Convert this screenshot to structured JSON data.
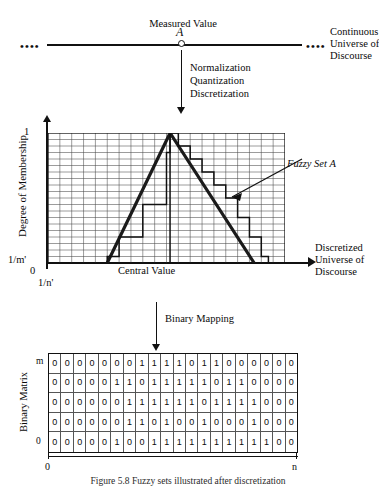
{
  "top": {
    "measured_value_label": "Measured Value",
    "point_symbol": "A",
    "universe_label_line1": "Continuous",
    "universe_label_line2": "Universe of",
    "universe_label_line3": "Discourse",
    "left_dots": "••••",
    "right_dots": "••••"
  },
  "transform_arrow": {
    "line1": "Normalization",
    "line2": "Quantization",
    "line3": "Discretization"
  },
  "chart": {
    "y_axis_title": "Degree of Membership",
    "y_tick_top": "1",
    "y_tick_min": "1/m'",
    "y_tick_zero": "0",
    "x_tick_res": "1/n'",
    "x_center_label": "Central Value",
    "x_axis_title_line1": "Discretized",
    "x_axis_title_line2": "Universe of",
    "x_axis_title_line3": "Discourse",
    "annotation": "Fuzzy Set A"
  },
  "binary_arrow": {
    "label": "Binary Mapping"
  },
  "matrix": {
    "title": "Binary Matrix",
    "row_top_label": "m",
    "row_bottom_label": "0",
    "x_start_label": "0",
    "x_end_label": "n"
  },
  "caption": {
    "text": "Figure 5.8   Fuzzy sets illustrated after discretization"
  },
  "chart_data": {
    "type": "line",
    "xlabel": "Discretized Universe of Discourse",
    "ylabel": "Degree of Membership",
    "xlim": [
      0,
      20
    ],
    "ylim": [
      0,
      1
    ],
    "grid": true,
    "grid_cols": 20,
    "grid_rows": 20,
    "legend": "none",
    "series": [
      {
        "name": "Fuzzy Set A (continuous triangle)",
        "type": "triangle",
        "points": [
          [
            5.0,
            0.0
          ],
          [
            10.3,
            1.0
          ],
          [
            17.4,
            0.0
          ]
        ]
      },
      {
        "name": "Fuzzy Set A (quantized staircase)",
        "type": "step",
        "x": [
          5,
          6,
          7,
          8,
          9,
          10,
          10.3,
          11,
          12,
          13,
          14,
          15,
          16,
          17,
          18
        ],
        "values": [
          0.05,
          0.2,
          0.2,
          0.45,
          0.45,
          0.85,
          1.0,
          0.9,
          0.8,
          0.7,
          0.6,
          0.5,
          0.35,
          0.2,
          0.05
        ]
      }
    ],
    "annotations": [
      {
        "text": "Fuzzy Set A",
        "x": 17.0,
        "y": 0.72
      },
      {
        "text": "Central Value",
        "x": 10.3,
        "y": 0.0
      }
    ]
  },
  "matrix_data": {
    "type": "table",
    "rows": 5,
    "cols": 20,
    "row_labels": [
      "m",
      "",
      "",
      "",
      "0"
    ],
    "values": [
      [
        "0",
        "0",
        "0",
        "0",
        "0",
        "0",
        "0",
        "1",
        "1",
        "1",
        "1",
        "0",
        "1",
        "1",
        "0",
        "0",
        "0",
        "0",
        "0",
        "0"
      ],
      [
        "0",
        "0",
        "0",
        "0",
        "0",
        "1",
        "1",
        "0",
        "1",
        "1",
        "1",
        "1",
        "1",
        "0",
        "1",
        "1",
        "0",
        "0",
        "0",
        "0"
      ],
      [
        "0",
        "0",
        "0",
        "0",
        "0",
        "0",
        "1",
        "1",
        "1",
        "1",
        "1",
        "1",
        "0",
        "1",
        "1",
        "1",
        "1",
        "0",
        "0",
        "0"
      ],
      [
        "0",
        "0",
        "0",
        "0",
        "0",
        "0",
        "1",
        "1",
        "0",
        "1",
        "0",
        "0",
        "1",
        "0",
        "0",
        "0",
        "1",
        "0",
        "0",
        "0"
      ],
      [
        "0",
        "0",
        "0",
        "0",
        "0",
        "1",
        "0",
        "0",
        "1",
        "1",
        "1",
        "1",
        "1",
        "1",
        "1",
        "1",
        "1",
        "1",
        "0",
        "0"
      ]
    ]
  }
}
